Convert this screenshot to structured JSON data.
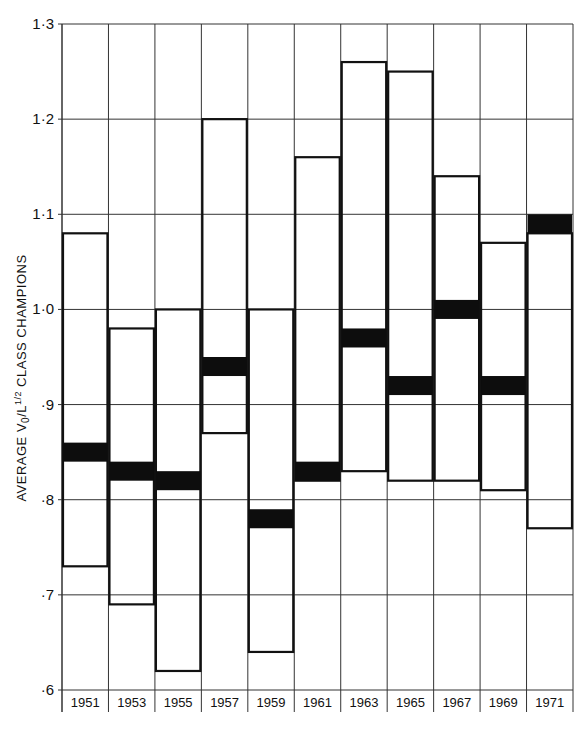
{
  "chart_data": {
    "type": "bar",
    "subtype": "floating-range-bar",
    "title": "",
    "xlabel": "",
    "ylabel": "AVERAGE V0/L 1/2 CLASS CHAMPIONS",
    "ylabel_parts": {
      "pre": "AVERAGE V",
      "sub": "0",
      "mid": "/L",
      "sup": "1/2",
      "post": " CLASS CHAMPIONS"
    },
    "ylim": [
      0.6,
      1.3
    ],
    "yticks": [
      0.6,
      0.7,
      0.8,
      0.9,
      1.0,
      1.1,
      1.2,
      1.3
    ],
    "ytick_labels": [
      "·6",
      "·7",
      "·8",
      "·9",
      "1·0",
      "1·1",
      "1·2",
      "1·3"
    ],
    "grid": true,
    "categories": [
      "1951",
      "1953",
      "1955",
      "1957",
      "1959",
      "1961",
      "1963",
      "1965",
      "1967",
      "1969",
      "1971"
    ],
    "series": [
      {
        "name": "max",
        "values": [
          1.08,
          0.98,
          1.0,
          1.2,
          1.0,
          1.16,
          1.26,
          1.25,
          1.14,
          1.07,
          1.08
        ]
      },
      {
        "name": "min",
        "values": [
          0.73,
          0.69,
          0.62,
          0.87,
          0.64,
          0.82,
          0.83,
          0.82,
          0.82,
          0.81,
          0.77
        ]
      },
      {
        "name": "average_band_low",
        "values": [
          0.84,
          0.82,
          0.81,
          0.93,
          0.77,
          0.82,
          0.96,
          0.91,
          0.99,
          0.91,
          1.08
        ]
      },
      {
        "name": "average_band_high",
        "values": [
          0.86,
          0.84,
          0.83,
          0.95,
          0.79,
          0.84,
          0.98,
          0.93,
          1.01,
          0.93,
          1.1
        ]
      }
    ],
    "colors": {
      "line": "#111111",
      "band": "#0d0d0d",
      "grid": "#333333",
      "background": "#ffffff"
    }
  }
}
